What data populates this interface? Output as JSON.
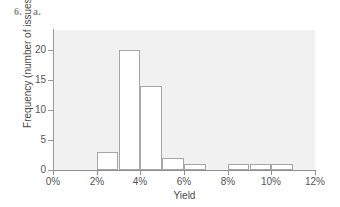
{
  "header": {
    "question_number": "6.",
    "question_part": "a."
  },
  "chart_data": {
    "type": "bar",
    "title": "",
    "subtitle": "",
    "xlabel": "Yield",
    "ylabel": "Frequency (number of issues)",
    "xlim": [
      0,
      12
    ],
    "ylim": [
      0,
      23.3
    ],
    "grid": false,
    "legend": null,
    "xtick_labels": [
      "0%",
      "2%",
      "4%",
      "6%",
      "8%",
      "10%",
      "12%"
    ],
    "xtick_values": [
      0,
      2,
      4,
      6,
      8,
      10,
      12
    ],
    "ytick_labels": [
      "0",
      "5",
      "10",
      "15",
      "20"
    ],
    "ytick_values": [
      0,
      5,
      10,
      15,
      20
    ],
    "bin_width": 1,
    "bin_unit": "%",
    "categories": [
      "0-1%",
      "1-2%",
      "2-3%",
      "3-4%",
      "4-5%",
      "5-6%",
      "6-7%",
      "7-8%",
      "8-9%",
      "9-10%",
      "10-11%",
      "11-12%"
    ],
    "bin_starts": [
      0,
      1,
      2,
      3,
      4,
      5,
      6,
      7,
      8,
      9,
      10,
      11
    ],
    "values": [
      0,
      0,
      3,
      20,
      14,
      2,
      1,
      0,
      1,
      1,
      1,
      0
    ],
    "bars": [
      {
        "label": "2-3%",
        "start": 2,
        "end": 3,
        "value": 3
      },
      {
        "label": "3-4%",
        "start": 3,
        "end": 4,
        "value": 20
      },
      {
        "label": "4-5%",
        "start": 4,
        "end": 5,
        "value": 14
      },
      {
        "label": "5-6%",
        "start": 5,
        "end": 6,
        "value": 2
      },
      {
        "label": "6-7%",
        "start": 6,
        "end": 7,
        "value": 1
      },
      {
        "label": "8-9%",
        "start": 8,
        "end": 9,
        "value": 1
      },
      {
        "label": "9-10%",
        "start": 9,
        "end": 10,
        "value": 1
      },
      {
        "label": "10-11%",
        "start": 10,
        "end": 11,
        "value": 1
      }
    ],
    "colors": {
      "bar_fill": "#ffffff",
      "bar_edge": "#a6a6a6",
      "plot_background": "#f1f1f1",
      "axis": "#8f8f8f",
      "text": "#4a4a4a",
      "page_background": "#ffffff"
    }
  }
}
